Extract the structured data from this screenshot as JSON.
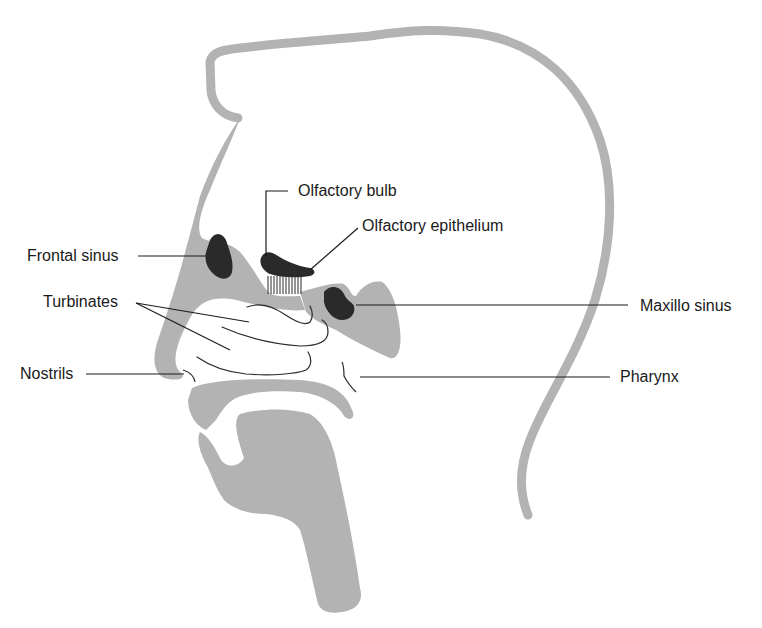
{
  "diagram": {
    "type": "anatomical-cross-section",
    "colors": {
      "tissue": "#b3b3b3",
      "sinus": "#2a2a2a",
      "leader_line": "#1a1a1a",
      "background": "#ffffff"
    },
    "labels": {
      "olfactory_bulb": "Olfactory bulb",
      "olfactory_epithelium": "Olfactory epithelium",
      "frontal_sinus": "Frontal sinus",
      "turbinates": "Turbinates",
      "maxillo_sinus": "Maxillo sinus",
      "nostrils": "Nostrils",
      "pharynx": "Pharynx"
    }
  }
}
